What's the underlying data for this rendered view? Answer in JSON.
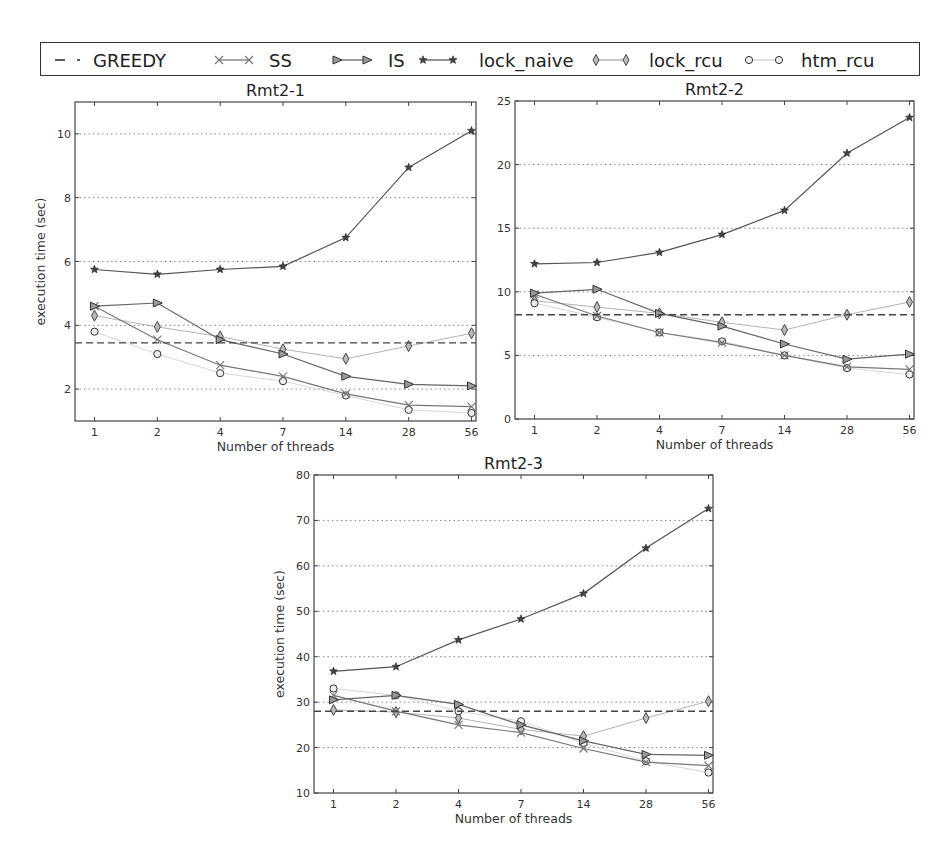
{
  "legend": {
    "items": [
      {
        "label": "GREEDY",
        "marker": "none",
        "style": "dashed"
      },
      {
        "label": "SS",
        "marker": "x"
      },
      {
        "label": "IS",
        "marker": "triangle-right"
      },
      {
        "label": "lock_naive",
        "marker": "star"
      },
      {
        "label": "lock_rcu",
        "marker": "thin-diamond"
      },
      {
        "label": "htm_rcu",
        "marker": "circle"
      }
    ]
  },
  "colors": {
    "GREEDY": "#444444",
    "SS": "#777777",
    "IS": "#666666",
    "lock_naive": "#555555",
    "lock_rcu": "#aaaaaa",
    "htm_rcu": "#cccccc",
    "grid": "#888888",
    "axis": "#444444"
  },
  "chart_data": [
    {
      "type": "line",
      "title": "Rmt2-1",
      "xlabel": "Number of threads",
      "ylabel": "execution time (sec)",
      "categories": [
        "1",
        "2",
        "4",
        "7",
        "14",
        "28",
        "56"
      ],
      "ylim": [
        1,
        11
      ],
      "yticks": [
        2,
        4,
        6,
        8,
        10
      ],
      "grid": "horizontal dotted",
      "series": [
        {
          "name": "GREEDY",
          "constant": 3.45
        },
        {
          "name": "SS",
          "values": [
            4.6,
            3.55,
            2.75,
            2.4,
            1.85,
            1.5,
            1.45
          ]
        },
        {
          "name": "IS",
          "values": [
            4.6,
            4.7,
            3.55,
            3.1,
            2.4,
            2.15,
            2.1
          ]
        },
        {
          "name": "lock_naive",
          "values": [
            5.75,
            5.6,
            5.75,
            5.85,
            6.75,
            8.95,
            10.1
          ]
        },
        {
          "name": "lock_rcu",
          "values": [
            4.3,
            3.95,
            3.65,
            3.25,
            2.95,
            3.35,
            3.75
          ]
        },
        {
          "name": "htm_rcu",
          "values": [
            3.8,
            3.1,
            2.5,
            2.25,
            1.8,
            1.35,
            1.25
          ]
        }
      ]
    },
    {
      "type": "line",
      "title": "Rmt2-2",
      "xlabel": "Number of threads",
      "ylabel": "",
      "categories": [
        "1",
        "2",
        "4",
        "7",
        "14",
        "28",
        "56"
      ],
      "ylim": [
        0,
        25
      ],
      "yticks": [
        0,
        5,
        10,
        15,
        20,
        25
      ],
      "grid": "horizontal dotted",
      "series": [
        {
          "name": "GREEDY",
          "constant": 8.2
        },
        {
          "name": "SS",
          "values": [
            9.8,
            8.1,
            6.8,
            6.0,
            5.0,
            4.1,
            3.9
          ]
        },
        {
          "name": "IS",
          "values": [
            9.9,
            10.2,
            8.3,
            7.3,
            5.9,
            4.7,
            5.1
          ]
        },
        {
          "name": "lock_naive",
          "values": [
            12.2,
            12.3,
            13.1,
            14.5,
            16.4,
            20.9,
            23.7
          ]
        },
        {
          "name": "lock_rcu",
          "values": [
            9.3,
            8.8,
            8.3,
            7.6,
            7.0,
            8.2,
            9.2
          ]
        },
        {
          "name": "htm_rcu",
          "values": [
            9.1,
            8.0,
            6.8,
            6.1,
            5.0,
            4.0,
            3.5
          ]
        }
      ]
    },
    {
      "type": "line",
      "title": "Rmt2-3",
      "xlabel": "Number of threads",
      "ylabel": "execution time (sec)",
      "categories": [
        "1",
        "2",
        "4",
        "7",
        "14",
        "28",
        "56"
      ],
      "ylim": [
        10,
        80
      ],
      "yticks": [
        10,
        20,
        30,
        40,
        50,
        60,
        70,
        80
      ],
      "grid": "horizontal dotted",
      "series": [
        {
          "name": "GREEDY",
          "constant": 28.0
        },
        {
          "name": "SS",
          "values": [
            31.5,
            28.0,
            25.0,
            23.3,
            19.8,
            16.8,
            16.0
          ]
        },
        {
          "name": "IS",
          "values": [
            30.5,
            31.5,
            29.5,
            25.0,
            21.5,
            18.5,
            18.3
          ]
        },
        {
          "name": "lock_naive",
          "values": [
            36.8,
            37.8,
            43.7,
            48.3,
            53.9,
            63.9,
            72.6
          ]
        },
        {
          "name": "lock_rcu",
          "values": [
            28.3,
            27.8,
            26.5,
            24.0,
            22.5,
            26.5,
            30.2
          ]
        },
        {
          "name": "htm_rcu",
          "values": [
            33.0,
            31.5,
            28.0,
            25.8,
            21.0,
            17.0,
            14.5
          ]
        }
      ]
    }
  ]
}
